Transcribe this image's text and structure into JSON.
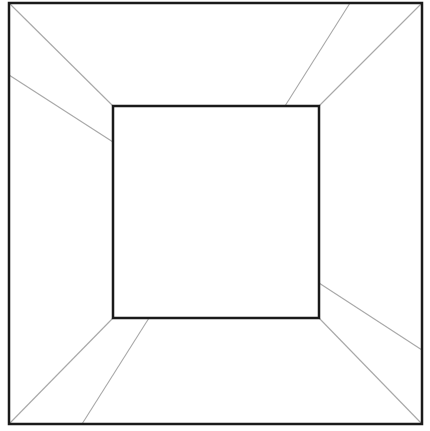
{
  "diagram": {
    "canvas": {
      "width": 430,
      "height": 431,
      "background": "#ffffff"
    },
    "colors": {
      "frame": "#1a1a1a",
      "guide": "#a8a8a8"
    },
    "outer_square": {
      "x1": 9,
      "y1": 3,
      "x2": 422,
      "y2": 424
    },
    "inner_square": {
      "x1": 113,
      "y1": 106,
      "x2": 319,
      "y2": 318
    },
    "corner_lines": [
      {
        "name": "top-left-corner-line",
        "x1": 9,
        "y1": 3,
        "x2": 113,
        "y2": 106
      },
      {
        "name": "top-right-corner-line",
        "x1": 422,
        "y1": 3,
        "x2": 319,
        "y2": 106
      },
      {
        "name": "bottom-left-corner-line",
        "x1": 9,
        "y1": 424,
        "x2": 113,
        "y2": 318
      },
      {
        "name": "bottom-right-corner-line",
        "x1": 422,
        "y1": 424,
        "x2": 319,
        "y2": 318
      }
    ],
    "panel_lines": [
      {
        "name": "left-panel-line",
        "x1": 9,
        "y1": 75,
        "x2": 113,
        "y2": 142
      },
      {
        "name": "top-panel-line",
        "x1": 350,
        "y1": 3,
        "x2": 285,
        "y2": 106
      },
      {
        "name": "bottom-panel-line",
        "x1": 82,
        "y1": 424,
        "x2": 149,
        "y2": 318
      },
      {
        "name": "right-panel-line",
        "x1": 422,
        "y1": 350,
        "x2": 319,
        "y2": 283
      }
    ]
  }
}
